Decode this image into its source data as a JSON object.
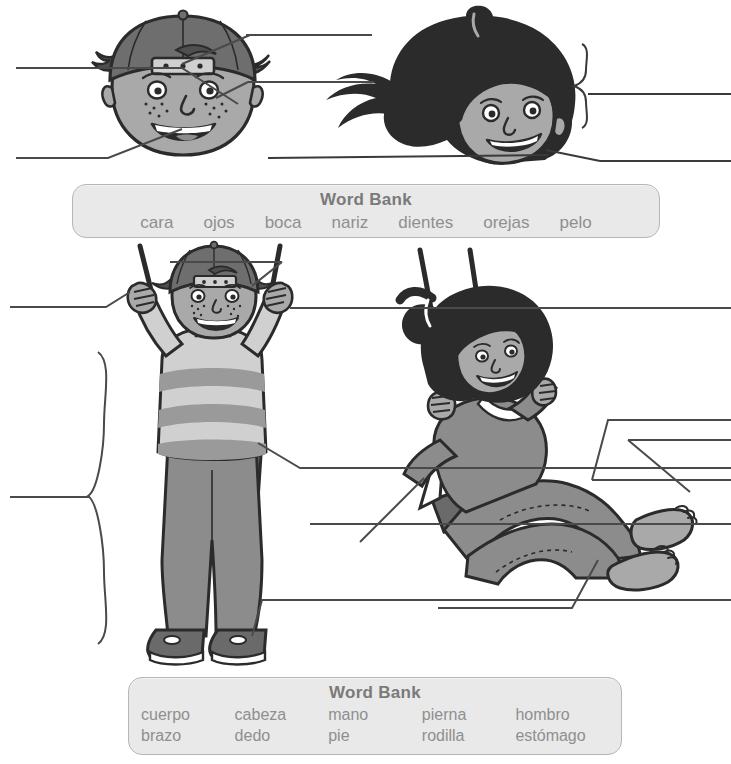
{
  "page": {
    "kind": "spanish-body-parts-labeling-worksheet",
    "background": "#ffffff",
    "width": 731,
    "height": 764
  },
  "word_banks": [
    {
      "id": "face",
      "title": "Word Bank",
      "rows": [
        [
          "cara",
          "ojos",
          "boca",
          "nariz",
          "dientes",
          "orejas",
          "pelo"
        ]
      ]
    },
    {
      "id": "body",
      "title": "Word Bank",
      "rows": [
        [
          "cuerpo",
          "cabeza",
          "mano",
          "pierna",
          "hombro"
        ],
        [
          "brazo",
          "dedo",
          "pie",
          "rodilla",
          "estómago"
        ]
      ]
    }
  ],
  "colors": {
    "ink": "#3a3a3a",
    "line": "#4a4a4a",
    "wordbank_fill": "#e9e9e9",
    "wordbank_border": "#b6b6b6",
    "wordbank_text": "#8f8f8f",
    "wordbank_title": "#7a7a7a",
    "skin": "#a9a9a9",
    "skin_shadow": "#8e8e8e",
    "hair_dark": "#2b2b2b",
    "cap": "#6e6e6e",
    "shirt_light": "#d0d0d0",
    "shirt_mid": "#9a9a9a",
    "denim": "#8c8c8c",
    "denim_dark": "#6f6f6f",
    "shoe": "#6a6a6a",
    "white": "#ffffff"
  },
  "illustrations": [
    {
      "id": "boy-head",
      "label": "boy head with backwards cap and freckles"
    },
    {
      "id": "girl-head",
      "label": "girl head with long dark hair and ponytail"
    },
    {
      "id": "boy-standing-swing",
      "label": "boy standing on a swing in striped shirt and jeans"
    },
    {
      "id": "girl-sitting-swing",
      "label": "girl sitting on a swing leaning back, barefoot"
    }
  ],
  "answer_lines": [
    {
      "id": "boy-head-left-top",
      "points": "to boy's nose"
    },
    {
      "id": "boy-head-left-bottom",
      "points": "to boy's mouth"
    },
    {
      "id": "boy-head-right-top",
      "points": "to boy's cap / head"
    },
    {
      "id": "boy-head-right-bottom",
      "points": "to boy's eye"
    },
    {
      "id": "girl-head-right-top",
      "points": "to girl's hair via brace"
    },
    {
      "id": "girl-head-right-bottom",
      "points": "to girl's face"
    },
    {
      "id": "boy-body-top",
      "points": "to boy's head region"
    },
    {
      "id": "boy-body-left-hand",
      "points": "to boy's hand"
    },
    {
      "id": "boy-body-left-brace",
      "points": "to boy's whole body via brace"
    },
    {
      "id": "boy-body-right-hand",
      "points": "to boy's right hand"
    },
    {
      "id": "boy-body-right-torso",
      "points": "to boy's stomach"
    },
    {
      "id": "boy-body-right-leg",
      "points": "to boy's leg"
    },
    {
      "id": "boy-body-right-foot",
      "points": "to boy's shoe"
    },
    {
      "id": "girl-body-right-upper",
      "points": "to girl's shoulder"
    },
    {
      "id": "girl-body-right-foot",
      "points": "to girl's foot"
    },
    {
      "id": "girl-body-left-arm",
      "points": "to girl's arm"
    },
    {
      "id": "girl-body-bottom-knee",
      "points": "to girl's knee"
    }
  ]
}
